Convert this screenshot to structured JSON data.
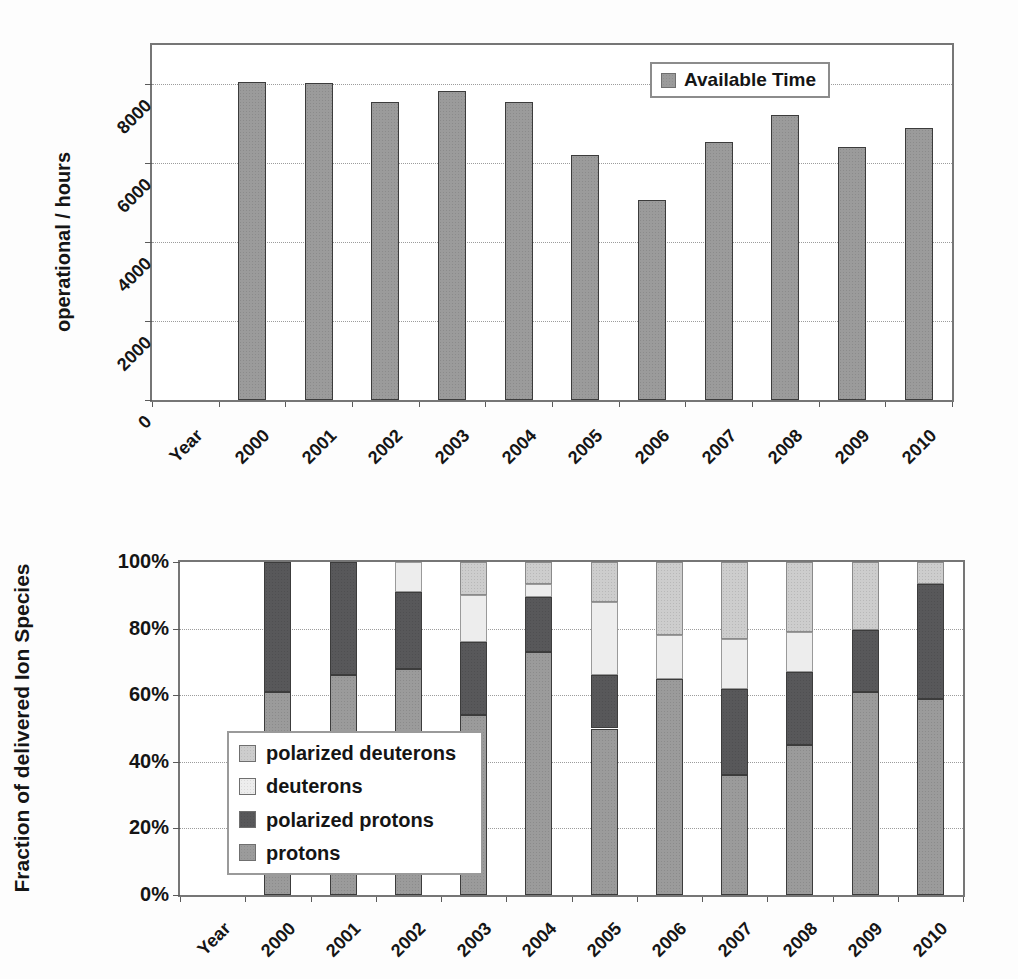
{
  "chart_data": [
    {
      "type": "bar",
      "title": "",
      "ylabel": "operational / hours",
      "x_first_label": "Year",
      "categories": [
        "2000",
        "2001",
        "2002",
        "2003",
        "2004",
        "2005",
        "2006",
        "2007",
        "2008",
        "2009",
        "2010"
      ],
      "values": [
        8060,
        8040,
        7560,
        7830,
        7560,
        6210,
        5070,
        6540,
        7230,
        6420,
        6900
      ],
      "ylim": [
        0,
        9000
      ],
      "yticks": [
        0,
        2000,
        4000,
        6000,
        8000
      ],
      "ytick_labels": [
        "0",
        "2000",
        "4000",
        "6000",
        "8000"
      ],
      "grid": true,
      "bar_color": "#9b9b9b",
      "legend": {
        "position": "inside-top-right",
        "label": "Available Time"
      }
    },
    {
      "type": "stacked-bar",
      "unit": "percent",
      "title": "",
      "ylabel": "Fraction of delivered Ion Species",
      "x_first_label": "Year",
      "categories": [
        "2000",
        "2001",
        "2002",
        "2003",
        "2004",
        "2005",
        "2006",
        "2007",
        "2008",
        "2009",
        "2010"
      ],
      "series": [
        {
          "name": "protons",
          "color": "#9b9b9b",
          "values": [
            61,
            66,
            68,
            54,
            73,
            50,
            65,
            36,
            45,
            61,
            59
          ]
        },
        {
          "name": "polarized protons",
          "color": "#58585a",
          "values": [
            39,
            34,
            23,
            22,
            16.5,
            16,
            0,
            26,
            22,
            18.5,
            34.5
          ]
        },
        {
          "name": "deuterons",
          "color": "#ededed",
          "values": [
            0,
            0,
            9,
            14,
            4,
            22,
            13,
            15,
            12,
            0,
            0
          ]
        },
        {
          "name": "polarized deuterons",
          "color": "#cdcdcd",
          "values": [
            0,
            0,
            0,
            10,
            6.5,
            12,
            22,
            23,
            21,
            20.5,
            6.5
          ]
        }
      ],
      "ylim": [
        0,
        100
      ],
      "ytick_percents": [
        0,
        20,
        40,
        60,
        80,
        100
      ],
      "yticks": [
        "0%",
        "20%",
        "40%",
        "60%",
        "80%",
        "100%"
      ],
      "grid": true,
      "legend": {
        "position": "inside-left",
        "items": [
          {
            "label": "polarized deuterons",
            "color": "#cdcdcd"
          },
          {
            "label": "deuterons",
            "color": "#ededed"
          },
          {
            "label": "polarized protons",
            "color": "#58585a"
          },
          {
            "label": "protons",
            "color": "#9b9b9b"
          }
        ]
      }
    }
  ]
}
